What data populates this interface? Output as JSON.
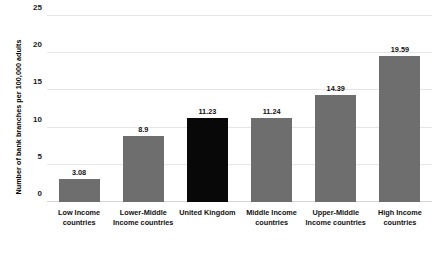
{
  "chart_data": {
    "type": "bar",
    "title": "",
    "xlabel": "",
    "ylabel": "Number of bank branches per 100,000 adults",
    "ylim": [
      0,
      25
    ],
    "ytick_values": [
      0,
      5,
      10,
      15,
      20,
      25
    ],
    "ytick_labels": [
      "0",
      "5",
      "10",
      "15",
      "20",
      "25"
    ],
    "grid": true,
    "legend": "none",
    "categories": [
      "Low Income countries",
      "Lower-Middle Income countries",
      "United Kingdom",
      "Middle Income countries",
      "Upper-Middle Income countries",
      "High Income countries"
    ],
    "category_lines": [
      [
        "Low Income",
        "countries"
      ],
      [
        "Lower-Middle",
        "Income countries"
      ],
      [
        "United Kingdom"
      ],
      [
        "Middle Income",
        "countries"
      ],
      [
        "Upper-Middle",
        "Income countries"
      ],
      [
        "High Income",
        "countries"
      ]
    ],
    "values": [
      3.08,
      8.9,
      11.23,
      11.24,
      14.39,
      19.59
    ],
    "value_labels": [
      "3.08",
      "8.9",
      "11.23",
      "11.24",
      "14.39",
      "19.59"
    ],
    "bar_colors": [
      "#6e6e6e",
      "#6e6e6e",
      "#080808",
      "#6e6e6e",
      "#6e6e6e",
      "#6e6e6e"
    ],
    "highlight_index": 2,
    "highlight_color": "#080808",
    "series_color": "#6e6e6e",
    "gridline_color": "#e6e6e6"
  }
}
